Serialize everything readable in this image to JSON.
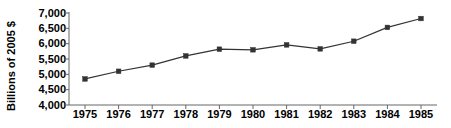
{
  "chart_data": {
    "type": "line",
    "title": "",
    "subtitle": "",
    "xlabel": "",
    "ylabel": "Billions of 2005 $",
    "categories": [
      "1975",
      "1976",
      "1977",
      "1978",
      "1979",
      "1980",
      "1981",
      "1982",
      "1983",
      "1984",
      "1985"
    ],
    "x": [
      1975,
      1976,
      1977,
      1978,
      1979,
      1980,
      1981,
      1982,
      1983,
      1984,
      1985
    ],
    "values": [
      4850,
      5100,
      5300,
      5600,
      5820,
      5800,
      5960,
      5830,
      6080,
      6530,
      6820
    ],
    "series": [
      {
        "name": "Billions of 2005 $",
        "values": [
          4850,
          5100,
          5300,
          5600,
          5820,
          5800,
          5960,
          5830,
          6080,
          6530,
          6820
        ]
      }
    ],
    "ylim": [
      4000,
      7000
    ],
    "ytick_values": [
      7000,
      6500,
      6000,
      5500,
      5000,
      4500,
      4000
    ],
    "ytick_labels": [
      "7,000",
      "6,500",
      "6,000",
      "5,500",
      "5,000",
      "4,500",
      "4,000"
    ],
    "xtick_labels": [
      "1975",
      "1976",
      "1977",
      "1978",
      "1979",
      "1980",
      "1981",
      "1982",
      "1983",
      "1984",
      "1985"
    ],
    "grid": false,
    "legend": false,
    "legend_position": "none",
    "marker": "square",
    "line_color": "#333333",
    "marker_color": "#333333",
    "axis_color": "#666666",
    "background_color": "#ffffff",
    "annotations": []
  }
}
